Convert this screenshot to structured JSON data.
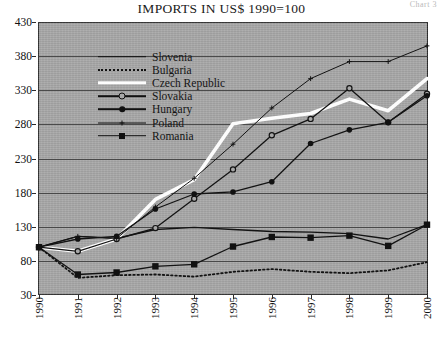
{
  "corner_note": "Chart 3",
  "chart_data": {
    "type": "line",
    "title": "IMPORTS IN US$ 1990=100",
    "xlabel": "",
    "ylabel": "",
    "x": [
      1990,
      1991,
      1992,
      1993,
      1994,
      1995,
      1996,
      1997,
      1998,
      1999,
      2000
    ],
    "categories": [
      "1990",
      "1991",
      "1992",
      "1993",
      "1994",
      "1995",
      "1996",
      "1997",
      "1998",
      "1999",
      "2000"
    ],
    "ylim": [
      30,
      430
    ],
    "yticks": [
      30,
      80,
      130,
      180,
      230,
      280,
      330,
      380,
      430
    ],
    "grid": true,
    "legend_position": "upper-left-inside",
    "series": [
      {
        "name": "Slovenia",
        "style": "solid",
        "marker": "none",
        "values": [
          100,
          116,
          113,
          126,
          129,
          126,
          123,
          122,
          120,
          112,
          133
        ]
      },
      {
        "name": "Bulgaria",
        "style": "dotted",
        "marker": "none",
        "values": [
          100,
          55,
          59,
          60,
          57,
          64,
          68,
          64,
          62,
          66,
          78
        ]
      },
      {
        "name": "Czech Republic",
        "style": "thick-white",
        "marker": "none",
        "values": [
          100,
          94,
          112,
          170,
          199,
          281,
          289,
          296,
          317,
          300,
          347
        ]
      },
      {
        "name": "Slovakia",
        "style": "solid",
        "marker": "open-circle",
        "values": [
          100,
          94,
          112,
          128,
          171,
          214,
          264,
          288,
          333,
          283,
          325
        ]
      },
      {
        "name": "Hungary",
        "style": "solid",
        "marker": "filled-circle",
        "values": [
          100,
          112,
          116,
          156,
          178,
          181,
          196,
          252,
          272,
          283,
          322
        ]
      },
      {
        "name": "Poland",
        "style": "thin",
        "marker": "small-plus",
        "values": [
          100,
          116,
          113,
          159,
          201,
          251,
          304,
          347,
          372,
          372,
          395
        ]
      },
      {
        "name": "Romania",
        "style": "solid",
        "marker": "filled-square",
        "values": [
          100,
          60,
          63,
          72,
          75,
          101,
          115,
          114,
          117,
          102,
          133
        ]
      }
    ]
  }
}
